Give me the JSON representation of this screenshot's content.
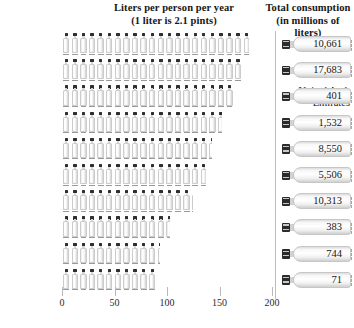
{
  "headers": {
    "left_line1": "Liters per person per year",
    "left_line2": "(1 liter is 2.1 pints)",
    "right_line1": "Total consumption",
    "right_line2": "(in millions of liters)"
  },
  "chart_data": {
    "type": "bar",
    "title": "Liters per person per year",
    "subtitle": "(1 liter is 2.1 pints)",
    "orientation": "horizontal",
    "xlabel": "",
    "ylabel": "",
    "xlim": [
      0,
      200
    ],
    "xticks": [
      0,
      50,
      100,
      150,
      200
    ],
    "xtick_labels": [
      "0",
      "50",
      "100",
      "150",
      "200"
    ],
    "grid": false,
    "legend": false,
    "pictogram_unit": "bottle",
    "categories": [
      "Italy",
      "Mexico",
      "United Arab Emirates",
      "Belgium",
      "France",
      "Spain",
      "Germany",
      "Lebanon",
      "Switzerland",
      "Cyprus"
    ],
    "values": [
      178,
      172,
      164,
      152,
      143,
      137,
      125,
      103,
      93,
      89
    ],
    "series": [
      {
        "name": "Liters per person per year",
        "values": [
          178,
          172,
          164,
          152,
          143,
          137,
          125,
          103,
          93,
          89
        ]
      },
      {
        "name": "Total consumption (in millions of liters)",
        "values": [
          10661,
          17683,
          401,
          1532,
          8550,
          5506,
          10313,
          383,
          744,
          71
        ],
        "labels": [
          "10,661",
          "17,683",
          "401",
          "1,532",
          "8,550",
          "5,506",
          "10,313",
          "383",
          "744",
          "71"
        ]
      }
    ]
  },
  "rows": [
    {
      "country": "Italy",
      "country_l1": "Italy",
      "country_l2": "",
      "liters": 178,
      "total_label": "10,661"
    },
    {
      "country": "Mexico",
      "country_l1": "Mexico",
      "country_l2": "",
      "liters": 172,
      "total_label": "17,683"
    },
    {
      "country": "United Arab Emirates",
      "country_l1": "United Arab",
      "country_l2": "Emirates",
      "liters": 164,
      "total_label": "401"
    },
    {
      "country": "Belgium",
      "country_l1": "Belgium",
      "country_l2": "",
      "liters": 152,
      "total_label": "1,532"
    },
    {
      "country": "France",
      "country_l1": "France",
      "country_l2": "",
      "liters": 143,
      "total_label": "8,550"
    },
    {
      "country": "Spain",
      "country_l1": "Spain",
      "country_l2": "",
      "liters": 137,
      "total_label": "5,506"
    },
    {
      "country": "Germany",
      "country_l1": "Germany",
      "country_l2": "",
      "liters": 125,
      "total_label": "10,313"
    },
    {
      "country": "Lebanon",
      "country_l1": "Lebanon",
      "country_l2": "",
      "liters": 103,
      "total_label": "383"
    },
    {
      "country": "Switzerland",
      "country_l1": "Switzerland",
      "country_l2": "",
      "liters": 93,
      "total_label": "744"
    },
    {
      "country": "Cyprus",
      "country_l1": "Cyprus",
      "country_l2": "",
      "liters": 89,
      "total_label": "71"
    }
  ],
  "axis": {
    "ticks": [
      "0",
      "50",
      "100",
      "150",
      "200"
    ],
    "tick_values": [
      0,
      50,
      100,
      150,
      200
    ]
  },
  "colors": {
    "background": "#ffffff",
    "text": "#1a1a1a",
    "bottle_cap": "#2e2e2e",
    "bottle_body": "#f2f2f2",
    "divider": "#bdbdbd",
    "tick": "#b9b9b9"
  }
}
